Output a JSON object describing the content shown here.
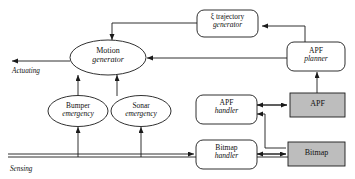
{
  "diagram": {
    "colors": {
      "stroke": "#1a1a1a",
      "fill_white": "#ffffff",
      "fill_gray": "#bdbdbd",
      "background": "#ffffff"
    },
    "axis_labels": {
      "actuating": "Actuating",
      "sensing": "Sensing"
    },
    "nodes": {
      "motion_generator": {
        "line1": "Motion",
        "line2": "generator",
        "shape": "ellipse",
        "fill": "white"
      },
      "trajectory_generator": {
        "line1": "ξ  trajectory",
        "line2": "generator",
        "shape": "rounded-rect",
        "fill": "white"
      },
      "apf_planner": {
        "line1": "APF",
        "line2": "planner",
        "shape": "rounded-rect",
        "fill": "white"
      },
      "bumper_emergency": {
        "line1": "Bumper",
        "line2": "emergency",
        "shape": "ellipse",
        "fill": "white"
      },
      "sonar_emergency": {
        "line1": "Sonar",
        "line2": "emergency",
        "shape": "ellipse",
        "fill": "white"
      },
      "apf_handler": {
        "line1": "APF",
        "line2": "handler",
        "shape": "rounded-rect",
        "fill": "white"
      },
      "bitmap_handler": {
        "line1": "Bitmap",
        "line2": "handler",
        "shape": "rounded-rect",
        "fill": "white"
      },
      "apf": {
        "line1": "APF",
        "line2": "",
        "shape": "rect",
        "fill": "gray"
      },
      "bitmap": {
        "line1": "Bitmap",
        "line2": "",
        "shape": "rect",
        "fill": "gray"
      }
    }
  }
}
